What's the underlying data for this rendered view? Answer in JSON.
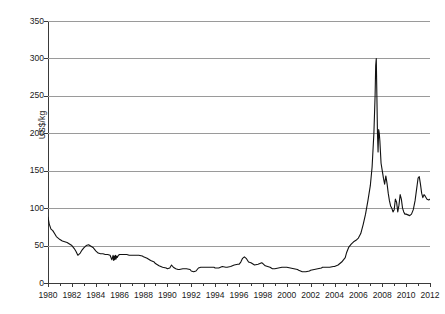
{
  "chart_data": {
    "type": "line",
    "title": "",
    "subtitle": "",
    "xlabel": "",
    "ylabel": "US$/kg",
    "xlim": [
      1980,
      2012
    ],
    "ylim": [
      0,
      350
    ],
    "grid": true,
    "grid_axis": "y",
    "legend": "none",
    "x_tick_labels": [
      "1980",
      "1982",
      "1984",
      "1986",
      "1988",
      "1990",
      "1992",
      "1994",
      "1996",
      "1998",
      "2000",
      "2002",
      "2004",
      "2006",
      "2008",
      "2010",
      "2012"
    ],
    "x_tick_values": [
      1980,
      1982,
      1984,
      1986,
      1988,
      1990,
      1992,
      1994,
      1996,
      1998,
      2000,
      2002,
      2004,
      2006,
      2008,
      2010,
      2012
    ],
    "x_minor_tick_values": [
      1981,
      1983,
      1985,
      1987,
      1989,
      1991,
      1993,
      1995,
      1997,
      1999,
      2001,
      2003,
      2005,
      2007,
      2009,
      2011
    ],
    "y_tick_labels": [
      "0",
      "50",
      "100",
      "150",
      "200",
      "250",
      "300",
      "350"
    ],
    "y_tick_values": [
      0,
      50,
      100,
      150,
      200,
      250,
      300,
      350
    ],
    "series": [
      {
        "name": "Price",
        "color": "#111111",
        "line_width": 1.1,
        "x": [
          1980.0,
          1980.1,
          1980.25,
          1980.4,
          1980.55,
          1980.7,
          1980.85,
          1981.0,
          1981.2,
          1981.4,
          1981.6,
          1981.8,
          1982.0,
          1982.2,
          1982.35,
          1982.5,
          1982.7,
          1982.85,
          1983.0,
          1983.2,
          1983.4,
          1983.6,
          1983.8,
          1984.0,
          1984.2,
          1984.4,
          1984.6,
          1984.8,
          1985.0,
          1985.2,
          1985.35,
          1985.45,
          1985.5,
          1985.55,
          1985.6,
          1985.65,
          1985.7,
          1985.75,
          1985.8,
          1985.9,
          1986.0,
          1986.2,
          1986.4,
          1986.6,
          1986.8,
          1987.0,
          1987.3,
          1987.6,
          1987.9,
          1988.0,
          1988.3,
          1988.6,
          1988.9,
          1989.0,
          1989.3,
          1989.6,
          1989.9,
          1990.0,
          1990.2,
          1990.35,
          1990.5,
          1990.7,
          1990.9,
          1991.0,
          1991.3,
          1991.6,
          1991.9,
          1992.0,
          1992.2,
          1992.4,
          1992.6,
          1992.8,
          1993.0,
          1993.3,
          1993.6,
          1993.9,
          1994.0,
          1994.3,
          1994.6,
          1994.9,
          1995.0,
          1995.3,
          1995.6,
          1995.9,
          1996.0,
          1996.15,
          1996.3,
          1996.45,
          1996.6,
          1996.8,
          1997.0,
          1997.3,
          1997.6,
          1997.9,
          1998.0,
          1998.2,
          1998.4,
          1998.6,
          1998.8,
          1999.0,
          1999.3,
          1999.6,
          1999.9,
          2000.0,
          2000.3,
          2000.6,
          2000.9,
          2001.0,
          2001.3,
          2001.6,
          2001.9,
          2002.0,
          2002.3,
          2002.6,
          2002.9,
          2003.0,
          2003.3,
          2003.6,
          2003.9,
          2004.0,
          2004.3,
          2004.6,
          2004.9,
          2005.0,
          2005.2,
          2005.4,
          2005.6,
          2005.8,
          2006.0,
          2006.2,
          2006.4,
          2006.6,
          2006.8,
          2007.0,
          2007.15,
          2007.3,
          2007.4,
          2007.45,
          2007.5,
          2007.55,
          2007.6,
          2007.65,
          2007.7,
          2007.75,
          2007.8,
          2007.85,
          2007.9,
          2008.0,
          2008.1,
          2008.2,
          2008.3,
          2008.4,
          2008.5,
          2008.6,
          2008.7,
          2008.8,
          2008.9,
          2009.0,
          2009.1,
          2009.2,
          2009.3,
          2009.4,
          2009.5,
          2009.6,
          2009.7,
          2009.8,
          2009.9,
          2010.0,
          2010.15,
          2010.3,
          2010.45,
          2010.6,
          2010.75,
          2010.9,
          2011.0,
          2011.1,
          2011.2,
          2011.3,
          2011.4,
          2011.5,
          2011.6,
          2011.75,
          2011.9,
          2012.0
        ],
        "y": [
          88,
          79,
          72,
          70,
          66,
          62,
          60,
          58,
          56,
          55,
          54,
          52,
          50,
          46,
          42,
          37,
          40,
          44,
          47,
          50,
          51,
          49,
          47,
          43,
          40,
          39,
          39,
          38,
          38,
          37,
          31,
          37,
          30,
          36,
          31,
          37,
          32,
          36,
          34,
          37,
          38,
          38,
          38,
          38,
          37,
          37,
          37,
          37,
          36,
          35,
          33,
          30,
          28,
          26,
          23,
          21,
          20,
          19,
          20,
          24,
          21,
          19,
          18,
          18,
          19,
          19,
          18,
          16,
          15,
          16,
          20,
          21,
          21,
          21,
          21,
          21,
          20,
          20,
          22,
          21,
          21,
          22,
          24,
          25,
          25,
          28,
          33,
          35,
          33,
          28,
          27,
          24,
          25,
          27,
          26,
          23,
          22,
          21,
          19,
          19,
          20,
          21,
          21,
          21,
          20,
          19,
          18,
          17,
          15,
          15,
          16,
          17,
          18,
          19,
          20,
          21,
          21,
          21,
          22,
          22,
          24,
          28,
          34,
          40,
          48,
          52,
          55,
          57,
          60,
          66,
          78,
          92,
          110,
          130,
          155,
          200,
          250,
          290,
          300,
          250,
          200,
          175,
          205,
          200,
          190,
          175,
          160,
          150,
          140,
          132,
          143,
          133,
          120,
          110,
          103,
          100,
          95,
          98,
          112,
          108,
          95,
          104,
          118,
          112,
          100,
          95,
          92,
          92,
          91,
          90,
          92,
          98,
          110,
          128,
          140,
          142,
          132,
          120,
          114,
          118,
          116,
          112,
          111,
          112
        ]
      }
    ]
  }
}
